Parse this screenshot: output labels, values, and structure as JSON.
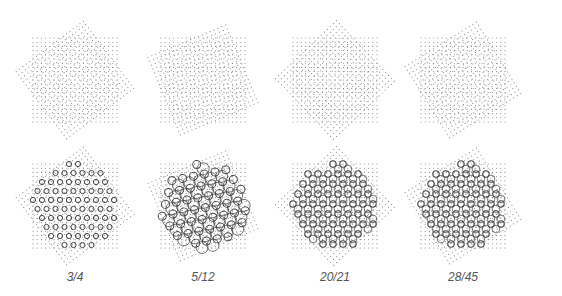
{
  "figure": {
    "columns": [
      {
        "ratio_label": "3/4",
        "angle_deg": 36.87,
        "cx": 75
      },
      {
        "ratio_label": "5/12",
        "angle_deg": 22.62,
        "cx": 203
      },
      {
        "ratio_label": "20/21",
        "angle_deg": 43.6,
        "cx": 335
      },
      {
        "ratio_label": "28/45",
        "angle_deg": 31.89,
        "cx": 463
      }
    ],
    "rows": [
      {
        "name": "dot-overlay",
        "cy": 80
      },
      {
        "name": "coincidence-pattern",
        "cy": 206
      }
    ],
    "colors": {
      "dots": "#888888",
      "pattern": "#444444",
      "label": "#555555"
    }
  }
}
